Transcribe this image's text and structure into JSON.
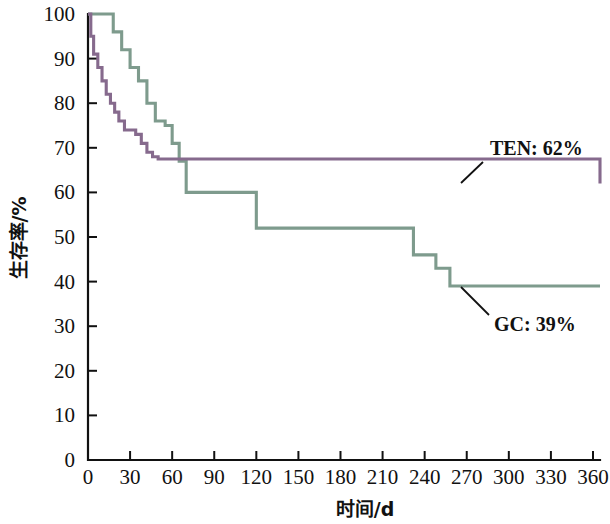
{
  "chart_data": {
    "type": "line",
    "title": "",
    "subtitle": "",
    "xlabel": "时间/d",
    "ylabel": "生存率/%",
    "xlim": [
      0,
      365
    ],
    "ylim": [
      0,
      100
    ],
    "xticks": [
      0,
      30,
      60,
      90,
      120,
      150,
      180,
      210,
      240,
      270,
      300,
      330,
      360
    ],
    "yticks": [
      0,
      10,
      20,
      30,
      40,
      50,
      60,
      70,
      80,
      90,
      100
    ],
    "xtick_labels": [
      "0",
      "30",
      "60",
      "90",
      "120",
      "150",
      "180",
      "210",
      "240",
      "270",
      "300",
      "330",
      "360"
    ],
    "ytick_labels": [
      "0",
      "10",
      "20",
      "30",
      "40",
      "50",
      "60",
      "70",
      "80",
      "90",
      "100"
    ],
    "grid": false,
    "legend_position": "inline-annotation",
    "curve_style": "step-post",
    "series": [
      {
        "name": "TEN",
        "label": "TEN: 62%",
        "color": "#866a8d",
        "final_survival_pct": 62,
        "x": [
          0,
          2,
          4,
          7,
          10,
          13,
          16,
          19,
          22,
          26,
          30,
          34,
          38,
          42,
          46,
          50,
          190,
          365
        ],
        "y": [
          100,
          95,
          91,
          88,
          85,
          82,
          80,
          78,
          76,
          74,
          74,
          73,
          71,
          69,
          68,
          67.5,
          67.5,
          62
        ]
      },
      {
        "name": "GC",
        "label": "GC: 39%",
        "color": "#7e9b8d",
        "final_survival_pct": 39,
        "x": [
          0,
          12,
          18,
          24,
          30,
          36,
          42,
          48,
          55,
          60,
          65,
          70,
          120,
          128,
          190,
          220,
          232,
          248,
          258,
          365
        ],
        "y": [
          100,
          100,
          96,
          92,
          88,
          85,
          80,
          76,
          75,
          71,
          67,
          60,
          52,
          52,
          52,
          52,
          46,
          43,
          39,
          39
        ]
      }
    ],
    "annotations": [
      {
        "name": "ten-annotation",
        "text": "TEN: 62%",
        "text_x": 490,
        "text_y": 155,
        "leader_from_x": 483,
        "leader_from_y": 162,
        "leader_to_x": 461,
        "leader_to_y": 183
      },
      {
        "name": "gc-annotation",
        "text": "GC: 39%",
        "text_x": 494,
        "text_y": 331,
        "leader_from_x": 489,
        "leader_from_y": 315,
        "leader_to_x": 461,
        "leader_to_y": 287
      }
    ]
  }
}
